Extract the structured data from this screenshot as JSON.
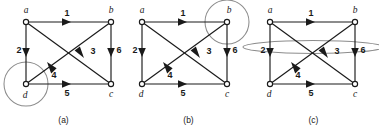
{
  "figure": {
    "type": "directed-graph-triptych",
    "panel_count": 3,
    "vertex_labels": [
      "a",
      "b",
      "d",
      "c"
    ],
    "edge_labels": [
      "1",
      "2",
      "3",
      "4",
      "5",
      "6"
    ],
    "colors": {
      "ink": "#1a1a1a",
      "highlight": "#8c8c8c",
      "background": "#ffffff"
    },
    "edges": [
      {
        "id": "1",
        "from": "a",
        "to": "b",
        "label": "1"
      },
      {
        "id": "2",
        "from": "a",
        "to": "d",
        "label": "2"
      },
      {
        "id": "3",
        "from": "a",
        "to": "c",
        "label": "3"
      },
      {
        "id": "4",
        "from": "d",
        "to": "b",
        "label": "4"
      },
      {
        "id": "5",
        "from": "d",
        "to": "c",
        "label": "5"
      },
      {
        "id": "6",
        "from": "b",
        "to": "c",
        "label": "6"
      }
    ]
  },
  "panels": [
    {
      "key": "a",
      "caption": "(a)",
      "vertices": {
        "a": "a",
        "b": "b",
        "d": "d",
        "c": "c"
      },
      "edges": {
        "e1": "1",
        "e2": "2",
        "e3": "3",
        "e4": "4",
        "e5": "5",
        "e6": "6"
      },
      "highlight": {
        "shape": "circle",
        "target": "d",
        "description": "circle around vertex d"
      }
    },
    {
      "key": "b",
      "caption": "(b)",
      "vertices": {
        "a": "a",
        "b": "b",
        "d": "d",
        "c": "c"
      },
      "edges": {
        "e1": "1",
        "e2": "2",
        "e3": "3",
        "e4": "4",
        "e5": "5",
        "e6": "6"
      },
      "highlight": {
        "shape": "circle",
        "target": "b",
        "description": "circle around vertex b"
      }
    },
    {
      "key": "c",
      "caption": "(c)",
      "vertices": {
        "a": "a",
        "b": "b",
        "d": "d",
        "c": "c"
      },
      "edges": {
        "e1": "1",
        "e2": "2",
        "e3": "3",
        "e4": "4",
        "e5": "5",
        "e6": "6"
      },
      "highlight": {
        "shape": "ellipse",
        "target": "edges-2-and-6",
        "description": "flat oval spanning edges 2 and 6"
      }
    }
  ]
}
